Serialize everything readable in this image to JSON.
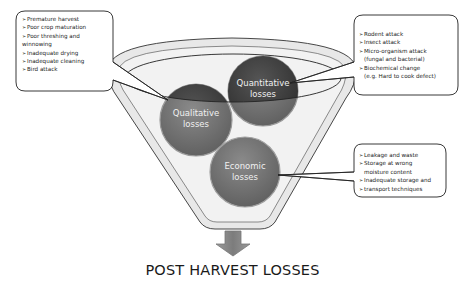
{
  "title": "POST HARVEST LOSSES",
  "circles": {
    "qualitative": {
      "line1": "Qualitative",
      "line2": "losses"
    },
    "quantitative": {
      "line1": "Quantitative",
      "line2": "losses"
    },
    "economic": {
      "line1": "Economic",
      "line2": "losses"
    }
  },
  "callouts": {
    "qualitative": {
      "marker": "➢",
      "items": [
        {
          "text": "Premature harvest"
        },
        {
          "text": "Poor crop maturation"
        },
        {
          "text": "Poor threshing and",
          "cont": "winnowing"
        },
        {
          "text": "Inadequate drying"
        },
        {
          "text": "Inadequate cleaning"
        },
        {
          "text": "Bird attack"
        }
      ]
    },
    "quantitative": {
      "marker": "➢",
      "items": [
        {
          "text": "Rodent attack"
        },
        {
          "text": "Insect attack"
        },
        {
          "text": "Micro-organism attack",
          "cont": "(fungal and bacterial)"
        },
        {
          "text": "Biochemical change",
          "cont": "(e.g. Hard to cook defect)"
        }
      ]
    },
    "economic": {
      "marker": "➢",
      "items": [
        {
          "text": "Leakage and waste"
        },
        {
          "text": "Storage at wrong",
          "cont": "moisture content"
        },
        {
          "text": "Inadequate storage and"
        },
        {
          "text": "transport techniques"
        }
      ]
    }
  },
  "colors": {
    "funnel_fill": "#e6e6e6",
    "funnel_stroke": "#333333",
    "circle_dark": "#3f3f3f",
    "circle_mid": "#6e6e6e",
    "circle_economic": "#7a7a7a",
    "arrow": "#8a8a8a"
  }
}
